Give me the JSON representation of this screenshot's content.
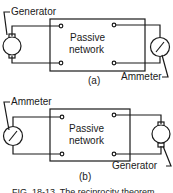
{
  "figure": {
    "panel_a": {
      "box_label_line1": "Passive",
      "box_label_line2": "network",
      "left_device": "Generator",
      "right_device": "Ammeter",
      "sublabel": "(a)"
    },
    "panel_b": {
      "box_label_line1": "Passive",
      "box_label_line2": "network",
      "left_device": "Ammeter",
      "right_device": "Generator",
      "sublabel": "(b)"
    },
    "caption": "FIG. 18-13. The reciprocity theorem"
  }
}
